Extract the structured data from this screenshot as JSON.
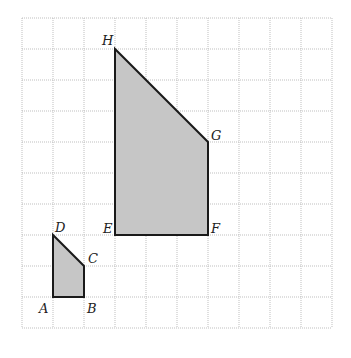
{
  "diagram": {
    "title": "",
    "grid": {
      "columns": 10,
      "rows": 10,
      "origin_px": [
        22,
        18
      ],
      "cell_px": 31
    },
    "colors": {
      "fill": "#c6c6c6",
      "stroke": "#1a1a1a",
      "grid": "#b8b8b8"
    },
    "shapes": [
      {
        "name": "small-quadrilateral",
        "vertices": [
          {
            "label": "A",
            "col": 1,
            "row": 9,
            "label_dx": -14,
            "label_dy": 16
          },
          {
            "label": "B",
            "col": 2,
            "row": 9,
            "label_dx": 3,
            "label_dy": 16
          },
          {
            "label": "C",
            "col": 2,
            "row": 8,
            "label_dx": 4,
            "label_dy": -3
          },
          {
            "label": "D",
            "col": 1,
            "row": 7,
            "label_dx": 2,
            "label_dy": -3
          }
        ]
      },
      {
        "name": "large-quadrilateral",
        "vertices": [
          {
            "label": "E",
            "col": 3,
            "row": 7,
            "label_dx": -12,
            "label_dy": -2
          },
          {
            "label": "F",
            "col": 6,
            "row": 7,
            "label_dx": 3,
            "label_dy": -2
          },
          {
            "label": "G",
            "col": 6,
            "row": 4,
            "label_dx": 3,
            "label_dy": -2
          },
          {
            "label": "H",
            "col": 3,
            "row": 1,
            "label_dx": -13,
            "label_dy": -4
          }
        ]
      }
    ]
  }
}
